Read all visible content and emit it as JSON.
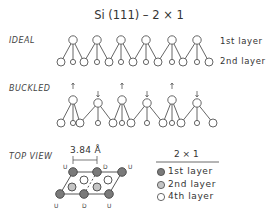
{
  "title": "Si (111) – 2 × 1",
  "sections": {
    "ideal": {
      "label": "IDEAL",
      "layer_labels": [
        "1st layer",
        "2nd layer"
      ]
    },
    "buckled": {
      "label": "BUCKLED"
    },
    "top_view": {
      "label": "TOP VIEW",
      "dimension": "3.84 Å",
      "site_labels_top": [
        "U",
        "D",
        "U"
      ],
      "site_labels_bottom": [
        "U",
        "D",
        "U"
      ]
    }
  },
  "legend": {
    "title": "2 × 1",
    "items": [
      {
        "label": "1st layer",
        "fill": "#7a7a7a"
      },
      {
        "label": "2nd layer",
        "fill": "#c4c4c4"
      },
      {
        "label": "4th layer",
        "fill": "#ffffff"
      }
    ]
  },
  "colors": {
    "line": "#555555",
    "first_layer": "#7a7a7a",
    "second_layer": "#c4c4c4",
    "fourth_layer": "#ffffff"
  }
}
